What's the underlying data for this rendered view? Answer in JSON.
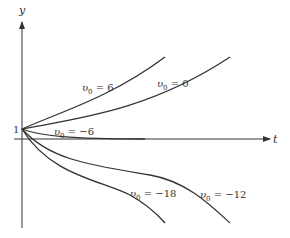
{
  "axes": {
    "y_label": "y",
    "x_label": "t",
    "y_tick_label": "1"
  },
  "curves": [
    {
      "id": "v0_6",
      "label_var": "υ",
      "label_sub": "0",
      "label_rest": " = 6"
    },
    {
      "id": "v0_0",
      "label_var": "υ",
      "label_sub": "0",
      "label_rest": " = 0"
    },
    {
      "id": "v0_m6",
      "label_var": "υ",
      "label_sub": "0",
      "label_rest": " = −6"
    },
    {
      "id": "v0_m18",
      "label_var": "υ",
      "label_sub": "0",
      "label_rest": " = −18"
    },
    {
      "id": "v0_m12",
      "label_var": "υ",
      "label_sub": "0",
      "label_rest": " = −12"
    }
  ],
  "colors": {
    "ink": "#333333",
    "background": "#ffffff"
  }
}
